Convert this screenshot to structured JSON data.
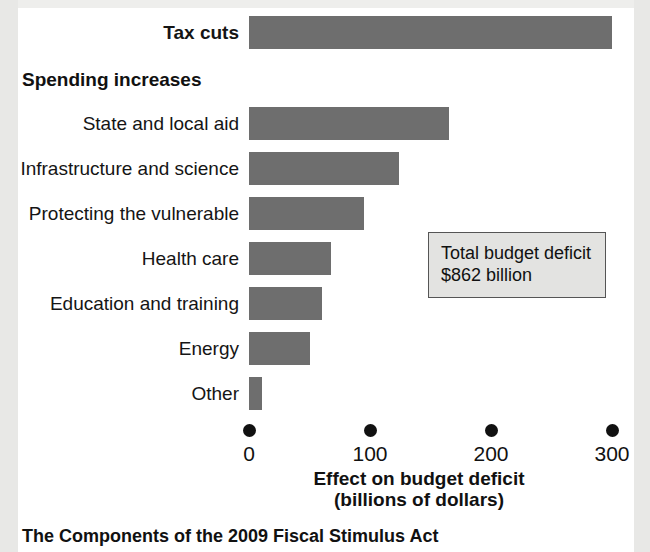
{
  "figure": {
    "caption": "The Components of the 2009 Fiscal Stimulus Act",
    "group_heading": "Spending increases",
    "note": {
      "line1": "Total budget deficit",
      "line2": "$862 billion"
    },
    "colors": {
      "bar": "#6e6e6e",
      "text": "#111111",
      "note_fill": "#e3e3e1",
      "note_border": "#555555",
      "background": "#ffffff",
      "page_edge": "#e8e8e6"
    }
  },
  "chart_data": {
    "type": "bar",
    "orientation": "horizontal",
    "title": "The Components of the 2009 Fiscal Stimulus Act",
    "xlabel": "Effect on budget deficit (billions of dollars)",
    "ylabel": "",
    "xlim": [
      0,
      300
    ],
    "xticks": [
      0,
      100,
      200,
      300
    ],
    "xticklabels": [
      "0",
      "100",
      "200",
      "300"
    ],
    "grid": false,
    "legend": null,
    "categories": [
      "Tax cuts",
      "State and local aid",
      "Infrastructure and science",
      "Protecting the vulnerable",
      "Health care",
      "Education and training",
      "Energy",
      "Other"
    ],
    "values": [
      300,
      165,
      124,
      95,
      68,
      60,
      50,
      11
    ],
    "annotations": [
      {
        "text": "Total budget deficit $862 billion",
        "total_deficit_billions": 862
      }
    ],
    "group_heading": "Spending increases"
  },
  "axis": {
    "title_line1": "Effect on budget deficit",
    "title_line2": "(billions of dollars)",
    "ticks": [
      {
        "label": "0",
        "value": 0
      },
      {
        "label": "100",
        "value": 100
      },
      {
        "label": "200",
        "value": 200
      },
      {
        "label": "300",
        "value": 300
      }
    ]
  },
  "rows": [
    {
      "label": "Tax cuts",
      "value": 300,
      "bold": true
    },
    {
      "label": "State and local aid",
      "value": 165,
      "bold": false
    },
    {
      "label": "Infrastructure and science",
      "value": 124,
      "bold": false
    },
    {
      "label": "Protecting the vulnerable",
      "value": 95,
      "bold": false
    },
    {
      "label": "Health care",
      "value": 68,
      "bold": false
    },
    {
      "label": "Education and training",
      "value": 60,
      "bold": false
    },
    {
      "label": "Energy",
      "value": 50,
      "bold": false
    },
    {
      "label": "Other",
      "value": 11,
      "bold": false
    }
  ]
}
